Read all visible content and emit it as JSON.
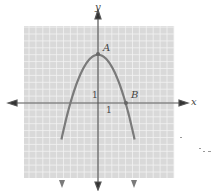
{
  "chart_data": {
    "type": "line",
    "title": "",
    "xlabel": "x",
    "ylabel": "y",
    "grid": true,
    "xlim": [
      -11,
      11
    ],
    "ylim": [
      -11,
      11
    ],
    "unit_label_x": "1",
    "unit_label_y": "1",
    "series": [
      {
        "name": "parabola",
        "equation": "y = 7 - (7/16) x^2",
        "vertex": [
          0,
          7
        ],
        "x_intercepts": [
          -4,
          4
        ],
        "color": "#7a7a7a"
      }
    ],
    "points": [
      {
        "label": "A",
        "x": 0,
        "y": 7
      },
      {
        "label": "B",
        "x": 4,
        "y": 0
      }
    ],
    "colors": {
      "grid_background": "#d9d9d9",
      "grid_lines": "#f2f2f2",
      "axes": "#555555",
      "curve": "#7a7a7a"
    }
  }
}
